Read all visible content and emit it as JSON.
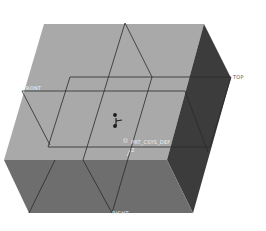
{
  "viewport": {
    "background": "#ffffff",
    "model": {
      "type": "box",
      "faces": {
        "top_color": "#a9a9a9",
        "front_color": "#6e6e6e",
        "right_color": "#3c3c3c"
      },
      "edge_color": "#2a2a2a"
    },
    "datum_planes": [
      {
        "name": "FRONT",
        "label": "FRONT"
      },
      {
        "name": "TOP",
        "label": "TOP"
      },
      {
        "name": "RIGHT",
        "label": "RIGHT"
      }
    ],
    "csys_label": "PRT_CSYS_DEF",
    "csys_axis_label": "Z"
  }
}
